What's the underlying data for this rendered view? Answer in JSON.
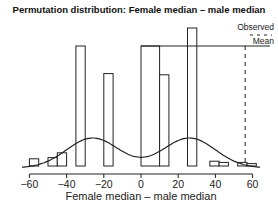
{
  "chart_data": {
    "type": "bar",
    "title": "Permutation distribution: Female median – male median",
    "xlabel": "Female median – male median",
    "ylabel": "",
    "xlim": [
      -60,
      60
    ],
    "xticks": [
      -60,
      -40,
      -20,
      0,
      20,
      40,
      60
    ],
    "xtick_labels": [
      "−60",
      "−40",
      "−20",
      "0",
      "20",
      "40",
      "60"
    ],
    "grid": false,
    "legend": {
      "entries": [
        "Observed",
        "Mean"
      ],
      "position": "top-right"
    },
    "bins": [
      {
        "x0": -60,
        "x1": -55,
        "height": 0.06
      },
      {
        "x0": -50,
        "x1": -45,
        "height": 0.07
      },
      {
        "x0": -45,
        "x1": -40,
        "height": 0.11
      },
      {
        "x0": -35,
        "x1": -30,
        "height": 1.0
      },
      {
        "x0": -20,
        "x1": -15,
        "height": 0.77
      },
      {
        "x0": 0,
        "x1": 10,
        "height": 1.0
      },
      {
        "x0": 10,
        "x1": 15,
        "height": 0.76
      },
      {
        "x0": 25,
        "x1": 30,
        "height": 1.15
      },
      {
        "x0": 37,
        "x1": 42,
        "height": 0.04
      },
      {
        "x0": 42,
        "x1": 47,
        "height": 0.03
      },
      {
        "x0": 52,
        "x1": 57,
        "height": 0.03
      },
      {
        "x0": 57,
        "x1": 62,
        "height": 0.02
      }
    ],
    "density_curve": {
      "description": "bimodal smooth density",
      "peaks": [
        -26,
        26
      ]
    },
    "observed_line_x": 56
  }
}
